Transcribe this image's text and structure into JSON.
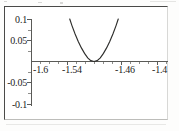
{
  "figure": {
    "alt_name": "parabola-plot",
    "frame_color": "#4a4a48",
    "curve_color": "#2e2e2c",
    "background": "#ffffff"
  },
  "chart_data": {
    "type": "line",
    "title": "",
    "subtitle": "",
    "xlabel": "",
    "ylabel": "",
    "xlim": [
      -1.6,
      -1.37
    ],
    "ylim": [
      -0.1,
      0.1
    ],
    "grid": false,
    "legend": null,
    "axis_style": "crossed-axes-at-origin",
    "x_ticks": [
      -1.6,
      -1.54,
      -1.46,
      -1.4
    ],
    "x_tick_labels": [
      "-1.6",
      "-1.54",
      "-1.46",
      "-1.4"
    ],
    "y_ticks": [
      -0.1,
      -0.05,
      0.05,
      0.1
    ],
    "y_tick_labels": [
      "-0.1",
      "-0.05",
      "0.05",
      "0.1"
    ],
    "series": [
      {
        "name": "parabola",
        "description": "upward parabola tangent to the x-axis, vertex at (-1.5, 0)",
        "vertex": [
          -1.5,
          0.0
        ],
        "x": [
          -1.5385,
          -1.535,
          -1.53,
          -1.525,
          -1.52,
          -1.515,
          -1.51,
          -1.505,
          -1.5,
          -1.495,
          -1.49,
          -1.485,
          -1.48,
          -1.475,
          -1.47,
          -1.465,
          -1.4615
        ],
        "y": [
          0.1,
          0.0845,
          0.0648,
          0.0473,
          0.032,
          0.0191,
          0.0084,
          0.0021,
          0.0,
          0.0021,
          0.0084,
          0.0191,
          0.032,
          0.0473,
          0.0648,
          0.0845,
          0.1
        ]
      }
    ]
  },
  "labels": {
    "y_top": "0.1",
    "y_upper_mid": "0.05",
    "y_lower_mid": "-0.05",
    "y_bottom": "-0.1",
    "x_first": "-1.6",
    "x_second": "-1.54",
    "x_third": "-1.46",
    "x_fourth": "-1.4"
  }
}
